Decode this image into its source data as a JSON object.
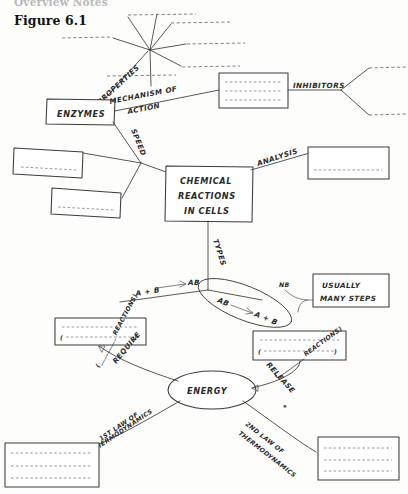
{
  "page": {
    "running_head": "Overview Notes",
    "figure_label": "Figure 6.1"
  },
  "diagram": {
    "type": "concept-map-worksheet",
    "center_node": {
      "id": "chemical-reactions",
      "lines": [
        "CHEMICAL",
        "REACTIONS",
        "IN CELLS"
      ]
    },
    "nodes": [
      {
        "id": "enzymes",
        "label": "ENZYMES"
      },
      {
        "id": "energy",
        "label": "ENERGY"
      },
      {
        "id": "usually-many-steps",
        "lines": [
          "USUALLY",
          "MANY STEPS"
        ]
      }
    ],
    "edge_labels": [
      {
        "id": "properties",
        "label": "PROPERTIES"
      },
      {
        "id": "mechanism-of-action",
        "lines": [
          "MECHANISM OF",
          "ACTION"
        ]
      },
      {
        "id": "inhibitors",
        "label": "INHIBITORS"
      },
      {
        "id": "speed",
        "label": "SPEED"
      },
      {
        "id": "analysis",
        "label": "ANALYSIS"
      },
      {
        "id": "types",
        "label": "TYPES"
      },
      {
        "id": "require",
        "label": "REQUIRE"
      },
      {
        "id": "require-reactions",
        "label": "(_________ REACTIONS)"
      },
      {
        "id": "release",
        "label": "RELEASE"
      },
      {
        "id": "release-reactions",
        "label": "(_________ REACTIONS)"
      },
      {
        "id": "first-law",
        "lines": [
          "1ST LAW OF",
          "THERMODYNAMICS"
        ]
      },
      {
        "id": "second-law",
        "lines": [
          "2ND LAW OF",
          "THERMODYNAMICS"
        ]
      }
    ],
    "equations": [
      {
        "id": "synthesis",
        "left": "A + B",
        "arrow": "→",
        "right": "AB"
      },
      {
        "id": "breakdown",
        "left": "AB",
        "arrow": "→",
        "right": "A + B"
      }
    ],
    "annotations": [
      {
        "id": "nb-note",
        "label": "NB"
      }
    ],
    "answer_boxes": [
      {
        "id": "mechanism-box",
        "blank_lines": 3
      },
      {
        "id": "speed-box-upper",
        "blank_lines": 1
      },
      {
        "id": "speed-box-lower",
        "blank_lines": 1
      },
      {
        "id": "analysis-box",
        "blank_lines": 1
      },
      {
        "id": "synthesis-box",
        "blank_lines": 2
      },
      {
        "id": "breakdown-box",
        "blank_lines": 2
      },
      {
        "id": "first-law-box",
        "blank_lines": 3
      },
      {
        "id": "second-law-box",
        "blank_lines": 3
      }
    ],
    "blank_spokes": {
      "properties_hub_count": 7,
      "inhibitors_count": 2
    }
  }
}
